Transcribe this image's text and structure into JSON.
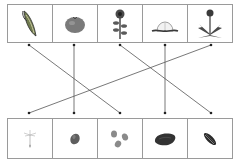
{
  "plants": [
    {
      "id": 1,
      "name": "corn cob",
      "icon": "corn-icon"
    },
    {
      "id": 2,
      "name": "tomato",
      "icon": "tomato-icon"
    },
    {
      "id": 3,
      "name": "sunflower",
      "icon": "sunflower-icon"
    },
    {
      "id": 4,
      "name": "peach",
      "icon": "peach-icon"
    },
    {
      "id": 5,
      "name": "dandelion",
      "icon": "dandelion-icon"
    }
  ],
  "seeds": [
    {
      "id": 1,
      "name": "dandelion seed",
      "icon": "dandelion-seed-icon"
    },
    {
      "id": 2,
      "name": "tomato seed",
      "icon": "tomato-seed-icon"
    },
    {
      "id": 3,
      "name": "corn kernels",
      "icon": "corn-kernels-icon"
    },
    {
      "id": 4,
      "name": "peach pit",
      "icon": "peach-pit-icon"
    },
    {
      "id": 5,
      "name": "sunflower seed",
      "icon": "sunflower-seed-icon"
    }
  ],
  "connections": [
    {
      "from_plant": 1,
      "to_seed": 3
    },
    {
      "from_plant": 2,
      "to_seed": 2
    },
    {
      "from_plant": 3,
      "to_seed": 5
    },
    {
      "from_plant": 4,
      "to_seed": 4
    },
    {
      "from_plant": 5,
      "to_seed": 1
    }
  ],
  "colors": {
    "border": "#9a9a9a",
    "line": "#555555",
    "dot": "#222222"
  }
}
